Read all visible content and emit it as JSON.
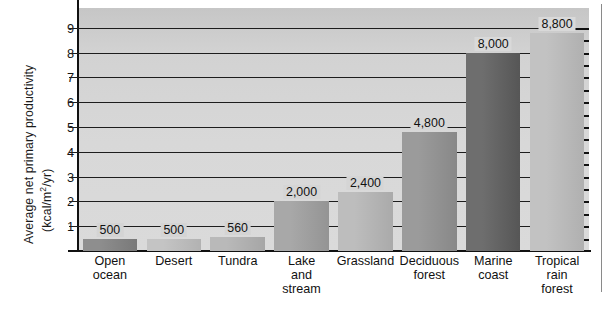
{
  "chart_data": {
    "type": "bar",
    "title": "",
    "subtitle": "",
    "xlabel": "",
    "ylabel": "Average net primary productivity",
    "ylabel_units": "(kcal/m2/yr)",
    "ylabel_units_parts": {
      "prefix": "(kcal/m",
      "superscript": "2",
      "suffix": "/yr)"
    },
    "categories": [
      "Open ocean",
      "Desert",
      "Tundra",
      "Lake and stream",
      "Grassland",
      "Deciduous forest",
      "Marine coast",
      "Tropical rain forest"
    ],
    "category_lines": [
      [
        "Open",
        "ocean"
      ],
      [
        "Desert"
      ],
      [
        "Tundra"
      ],
      [
        "Lake",
        "and",
        "stream"
      ],
      [
        "Grassland"
      ],
      [
        "Deciduous",
        "forest"
      ],
      [
        "Marine",
        "coast"
      ],
      [
        "Tropical",
        "rain",
        "forest"
      ]
    ],
    "values": [
      500,
      500,
      560,
      2000,
      2400,
      4800,
      8000,
      8800
    ],
    "value_labels": [
      "500",
      "500",
      "560",
      "2,000",
      "2,400",
      "4,800",
      "8,000",
      "8,800"
    ],
    "bar_colors": [
      "#8e8e8e",
      "#c4c4c4",
      "#b9b9b9",
      "#a8a8a8",
      "#bdbdbd",
      "#9b9b9b",
      "#6e6e6e",
      "#c2c2c2"
    ],
    "bar_colors_right": [
      "#797979",
      "#b2b2b2",
      "#a6a6a6",
      "#949494",
      "#aaaaaa",
      "#888888",
      "#565656",
      "#b0b0b0"
    ],
    "ylim": [
      0,
      9800
    ],
    "yticks": [
      1,
      2,
      3,
      4,
      5,
      6,
      7,
      8,
      9
    ],
    "ytick_labels": [
      "1",
      "2",
      "3",
      "4",
      "5",
      "6",
      "7",
      "8",
      "9"
    ],
    "ytick_unit_scale": 1000,
    "grid": true,
    "grid_axis": "y",
    "legend": false,
    "legend_position": "none",
    "plot_background": "#d6d6d6",
    "axis_color": "#111111"
  }
}
